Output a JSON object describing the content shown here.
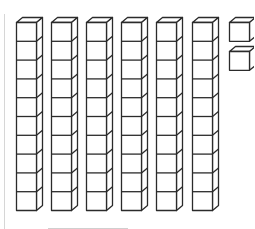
{
  "figure": {
    "tens_rods": 6,
    "cubes_per_rod": 10,
    "unit_cubes": 2,
    "represented_value": 62
  },
  "layout": {
    "rod_x": [
      16,
      51,
      86,
      121,
      156,
      192
    ],
    "rod_top": 22,
    "cube_w": 20,
    "cube_h": 18.8,
    "depth_dx": 6,
    "depth_dy": 5,
    "unit_x": 229,
    "unit_y": [
      22,
      51
    ],
    "stroke": "#2b2b2b",
    "guide_color": "#d6d6d6"
  },
  "answer_line": {
    "x1": 48,
    "x2": 128,
    "y": 228
  }
}
